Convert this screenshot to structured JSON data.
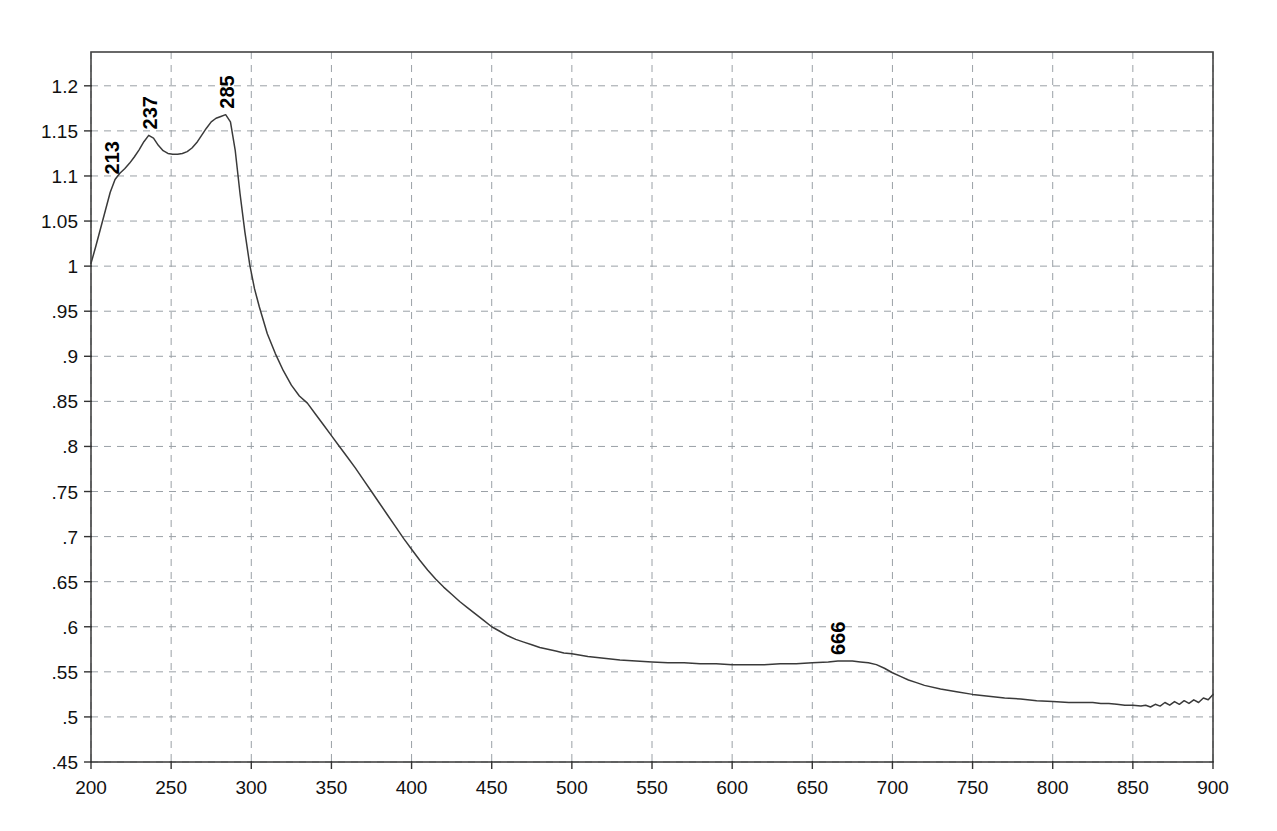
{
  "chart_data": {
    "type": "line",
    "title": "",
    "subtitle": "",
    "xlabel": "",
    "ylabel": "",
    "xlim": [
      200,
      900
    ],
    "ylim": [
      0.45,
      1.2375
    ],
    "grid": true,
    "legend": null,
    "x_ticks": [
      200,
      250,
      300,
      350,
      400,
      450,
      500,
      550,
      600,
      650,
      700,
      750,
      800,
      850,
      900
    ],
    "x_tick_labels": [
      "200",
      "250",
      "300",
      "350",
      "400",
      "450",
      "500",
      "550",
      "600",
      "650",
      "700",
      "750",
      "800",
      "850",
      "900"
    ],
    "y_ticks": [
      0.45,
      0.5,
      0.55,
      0.6,
      0.65,
      0.7,
      0.75,
      0.8,
      0.85,
      0.9,
      0.95,
      1.0,
      1.05,
      1.1,
      1.15,
      1.2
    ],
    "y_tick_labels": [
      ".45",
      ".5",
      ".55",
      ".6",
      ".65",
      ".7",
      ".75",
      ".8",
      ".85",
      ".9",
      ".95",
      "1",
      "1.05",
      "1.1",
      "1.15",
      "1.2"
    ],
    "annotations": [
      {
        "label": "213",
        "x": 213,
        "y": 1.095,
        "orientation": "vertical"
      },
      {
        "label": "237",
        "x": 237,
        "y": 1.145,
        "orientation": "vertical"
      },
      {
        "label": "285",
        "x": 285,
        "y": 1.168,
        "orientation": "vertical"
      },
      {
        "label": "666",
        "x": 666,
        "y": 0.562,
        "orientation": "vertical"
      }
    ],
    "series": [
      {
        "name": "absorbance",
        "color": "#3a3a3a",
        "x": [
          200,
          203,
          206,
          209,
          212,
          215,
          218,
          221,
          224,
          227,
          230,
          233,
          236,
          239,
          242,
          245,
          248,
          251,
          254,
          257,
          260,
          263,
          266,
          269,
          272,
          275,
          278,
          281,
          284,
          287,
          290,
          293,
          296,
          299,
          302,
          305,
          310,
          315,
          320,
          325,
          330,
          335,
          340,
          345,
          350,
          355,
          360,
          365,
          370,
          375,
          380,
          385,
          390,
          395,
          400,
          405,
          410,
          415,
          420,
          425,
          430,
          435,
          440,
          445,
          450,
          455,
          460,
          465,
          470,
          475,
          480,
          485,
          490,
          495,
          500,
          510,
          520,
          530,
          540,
          550,
          560,
          570,
          580,
          590,
          600,
          610,
          620,
          630,
          640,
          650,
          660,
          666,
          670,
          675,
          680,
          685,
          690,
          695,
          700,
          705,
          710,
          715,
          720,
          730,
          740,
          750,
          760,
          770,
          780,
          790,
          800,
          810,
          815,
          820,
          825,
          830,
          835,
          840,
          845,
          850,
          855,
          858,
          861,
          864,
          867,
          870,
          873,
          876,
          879,
          882,
          885,
          888,
          891,
          894,
          897,
          900
        ],
        "y": [
          1.003,
          1.022,
          1.042,
          1.062,
          1.082,
          1.096,
          1.103,
          1.108,
          1.114,
          1.121,
          1.129,
          1.138,
          1.145,
          1.142,
          1.134,
          1.128,
          1.125,
          1.124,
          1.124,
          1.125,
          1.127,
          1.131,
          1.137,
          1.145,
          1.153,
          1.16,
          1.164,
          1.166,
          1.168,
          1.16,
          1.128,
          1.08,
          1.038,
          1.002,
          0.975,
          0.955,
          0.925,
          0.903,
          0.884,
          0.868,
          0.856,
          0.848,
          0.836,
          0.824,
          0.812,
          0.8,
          0.788,
          0.776,
          0.763,
          0.75,
          0.737,
          0.724,
          0.711,
          0.698,
          0.686,
          0.674,
          0.663,
          0.653,
          0.644,
          0.636,
          0.628,
          0.621,
          0.614,
          0.607,
          0.6,
          0.595,
          0.59,
          0.586,
          0.583,
          0.58,
          0.577,
          0.575,
          0.573,
          0.571,
          0.57,
          0.567,
          0.565,
          0.563,
          0.562,
          0.561,
          0.56,
          0.56,
          0.559,
          0.559,
          0.558,
          0.558,
          0.558,
          0.559,
          0.559,
          0.56,
          0.561,
          0.562,
          0.562,
          0.562,
          0.561,
          0.56,
          0.558,
          0.554,
          0.549,
          0.545,
          0.541,
          0.538,
          0.535,
          0.531,
          0.528,
          0.525,
          0.523,
          0.521,
          0.52,
          0.518,
          0.517,
          0.516,
          0.516,
          0.516,
          0.516,
          0.515,
          0.515,
          0.514,
          0.513,
          0.513,
          0.512,
          0.513,
          0.511,
          0.514,
          0.512,
          0.516,
          0.513,
          0.517,
          0.514,
          0.518,
          0.515,
          0.519,
          0.516,
          0.521,
          0.519,
          0.525
        ]
      }
    ]
  }
}
